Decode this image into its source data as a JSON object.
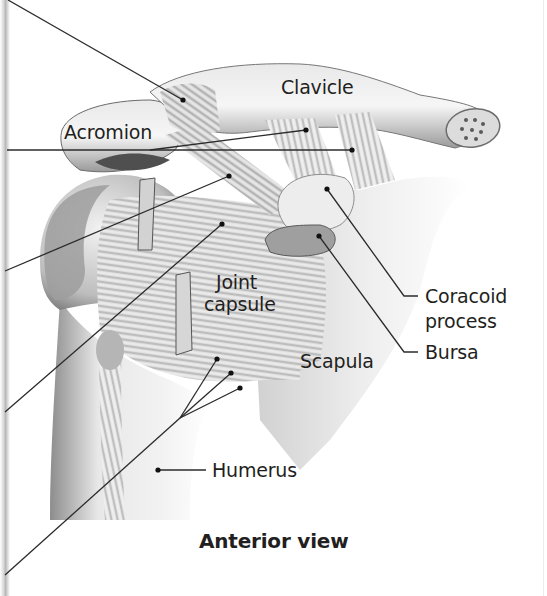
{
  "figure": {
    "caption": "Anterior view",
    "background": "#ffffff",
    "ink_color": "#231f20",
    "bone_light": "#f1f1f1",
    "bone_mid": "#c9c9c9",
    "bone_dark": "#5e5e5e"
  },
  "labels": {
    "clavicle": "Clavicle",
    "acromion": "Acromion",
    "joint_capsule_line1": "Joint",
    "joint_capsule_line2": "capsule",
    "coracoid_line1": "Coracoid",
    "coracoid_line2": "process",
    "bursa": "Bursa",
    "scapula": "Scapula",
    "humerus": "Humerus"
  },
  "leader_lines": [
    {
      "name": "upper-ligament-leader",
      "from": [
        8,
        0
      ],
      "to": [
        183,
        100
      ]
    },
    {
      "name": "trapezoid-ligament-leader",
      "from": [
        150,
        150
      ],
      "to": [
        306,
        130
      ]
    },
    {
      "name": "conoid-ligament-leader",
      "from": [
        7,
        150
      ],
      "to": [
        352,
        150
      ]
    },
    {
      "name": "coracoacromial-ligament-leader",
      "from": [
        5,
        271
      ],
      "to": [
        229,
        176
      ]
    },
    {
      "name": "coracohumeral-ligament-leader",
      "from": [
        5,
        412
      ],
      "to": [
        222,
        224
      ]
    },
    {
      "name": "glenohumeral-ligaments-leader",
      "from": [
        5,
        575
      ],
      "to": [
        180,
        418
      ]
    },
    {
      "name": "coracoid-leader",
      "from": [
        327,
        189
      ],
      "to": [
        404,
        296
      ]
    },
    {
      "name": "bursa-leader",
      "from": [
        319,
        236
      ],
      "to": [
        404,
        352
      ]
    },
    {
      "name": "humerus-leader",
      "from": [
        158,
        470
      ],
      "to": [
        206,
        470
      ]
    }
  ]
}
